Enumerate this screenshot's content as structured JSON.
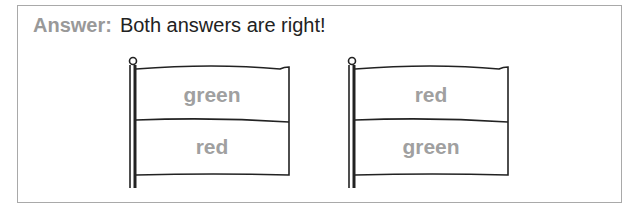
{
  "answer": {
    "label": "Answer:",
    "text": "Both answers are right!"
  },
  "flags": [
    {
      "top": "green",
      "bottom": "red"
    },
    {
      "top": "red",
      "bottom": "green"
    }
  ],
  "colors": {
    "label": "#999999",
    "flag_text": "#a0a0a0",
    "outline": "#222222"
  }
}
